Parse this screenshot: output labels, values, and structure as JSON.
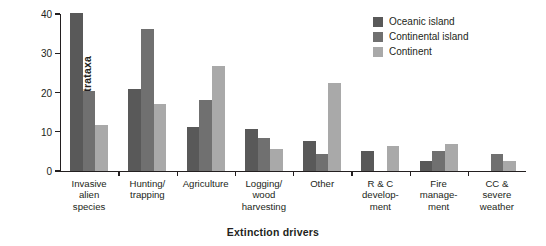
{
  "chart_data": {
    "type": "bar",
    "title": "",
    "xlabel": "Extinction drivers",
    "ylabel": "% ultrataxa",
    "ylim": [
      0,
      40
    ],
    "yticks": [
      0,
      10,
      20,
      30,
      40
    ],
    "grid": false,
    "legend_position": "top-right",
    "categories": [
      "Invasive\nalien\nspecies",
      "Hunting/\ntrapping",
      "Agriculture",
      "Logging/\nwood\nharvesting",
      "Other",
      "R & C\ndevelop-\nment",
      "Fire\nmanage-\nment",
      "CC &\nsevere\nweather"
    ],
    "series": [
      {
        "name": "Oceanic island",
        "color": "#595959",
        "values": [
          40.2,
          20.8,
          11.3,
          10.6,
          7.7,
          5.0,
          2.5,
          0.0
        ]
      },
      {
        "name": "Continental island",
        "color": "#707070",
        "values": [
          20.3,
          36.3,
          18.2,
          8.3,
          4.4,
          0.0,
          5.2,
          4.4
        ]
      },
      {
        "name": "Continent",
        "color": "#a9a9a9",
        "values": [
          11.7,
          17.1,
          26.8,
          5.5,
          22.4,
          6.4,
          7.0,
          2.6
        ]
      }
    ],
    "axis_color": "#231f20"
  }
}
